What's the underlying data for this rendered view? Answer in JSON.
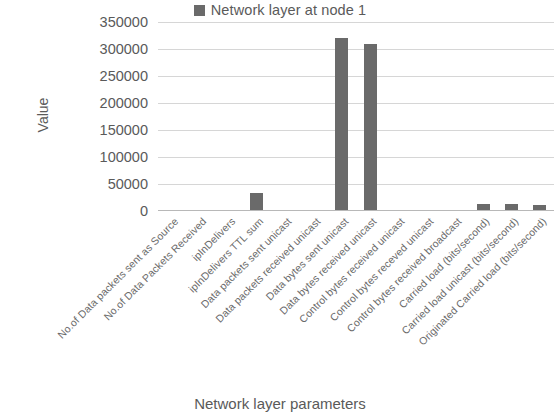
{
  "legend": {
    "swatch_color": "#6a6a6a",
    "label": "Network layer at node 1"
  },
  "axes": {
    "y_title": "Value",
    "x_title": "Network layer parameters"
  },
  "chart_data": {
    "type": "bar",
    "title": "",
    "series_name": "Network layer at node 1",
    "xlabel": "Network layer parameters",
    "ylabel": "Value",
    "ylim": [
      0,
      350000
    ],
    "y_ticks": [
      0,
      50000,
      100000,
      150000,
      200000,
      250000,
      300000,
      350000
    ],
    "y_tick_labels": [
      "0",
      "50000",
      "100000",
      "150000",
      "200000",
      "250000",
      "300000",
      "350000"
    ],
    "grid": true,
    "legend_position": "top-center",
    "bar_color": "#6a6a6a",
    "categories": [
      "No.of Data packets sent as Source",
      "No.of Data Packets Received",
      "ipInDelivers",
      "ipInDelivers TTL sum",
      "Data packets sent unicast",
      "Data packets received unicast",
      "Data bytes sent unicast",
      "Data bytes received unicast",
      "Control bytes received unicast",
      "Control bytes receved unicast",
      "Control bytes received broadcast",
      "Carried load (bits/second)",
      "Carried load unicast (bits/second)",
      "Originated Carried load (bits/second)"
    ],
    "values": [
      0,
      0,
      0,
      33000,
      0,
      0,
      320000,
      309000,
      0,
      0,
      2000,
      13000,
      13000,
      12000
    ]
  }
}
